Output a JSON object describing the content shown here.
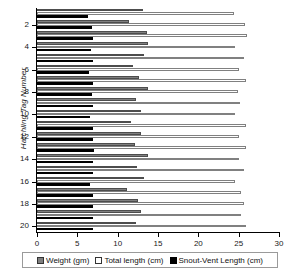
{
  "chart_data": {
    "type": "bar",
    "orientation": "horizontal",
    "title": "",
    "xlabel": "",
    "ylabel": "Hatchling Tag Number",
    "xlim": [
      0,
      30
    ],
    "xticks": [
      0,
      5,
      10,
      15,
      20,
      25,
      30
    ],
    "yticks": [
      2,
      4,
      6,
      8,
      10,
      12,
      14,
      16,
      18,
      20
    ],
    "categories": [
      1,
      2,
      3,
      4,
      5,
      6,
      7,
      8,
      9,
      10,
      11,
      12,
      13,
      14,
      15,
      16,
      17,
      18,
      19,
      20
    ],
    "grid": false,
    "legend_position": "bottom",
    "series": [
      {
        "name": "Weight  (gm)",
        "color": "#7f7f7f",
        "values": [
          13.1,
          11.4,
          13.6,
          13.8,
          13.3,
          11.9,
          12.7,
          13.7,
          12.3,
          12.9,
          11.6,
          12.9,
          12.1,
          13.8,
          12.4,
          13.3,
          11.2,
          12.5,
          12.9,
          12.3
        ]
      },
      {
        "name": "Total  length  (cm)",
        "color": "#ffffff",
        "values": [
          24.4,
          25.8,
          26.0,
          24.6,
          25.6,
          25.1,
          25.9,
          24.9,
          25.2,
          24.6,
          25.9,
          25.1,
          25.9,
          25.1,
          25.7,
          24.6,
          25.3,
          25.6,
          25.3,
          25.9
        ]
      },
      {
        "name": "Snout-Vent  Length  (cm)",
        "color": "#000000",
        "values": [
          6.3,
          6.8,
          7.0,
          6.7,
          7.0,
          6.5,
          6.9,
          6.8,
          7.0,
          6.6,
          7.0,
          7.0,
          7.1,
          7.0,
          7.0,
          6.6,
          6.9,
          7.0,
          7.0,
          7.0
        ]
      }
    ]
  },
  "legend": {
    "items": [
      {
        "label": "Weight  (gm)",
        "swatch": "weight-swatch"
      },
      {
        "label": "Total  length  (cm)",
        "swatch": "total-length-swatch"
      },
      {
        "label": "Snout-Vent  Length  (cm)",
        "swatch": "snout-vent-swatch"
      }
    ]
  },
  "axes": {
    "x_tick_labels": [
      "0",
      "5",
      "10",
      "15",
      "20",
      "25",
      "30"
    ],
    "y_tick_labels": [
      "2",
      "4",
      "6",
      "8",
      "10",
      "12",
      "14",
      "16",
      "18",
      "20"
    ],
    "y_title": "Hatchling Tag Number"
  }
}
